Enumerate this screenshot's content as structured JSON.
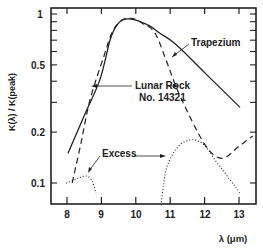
{
  "chart_data": {
    "type": "line",
    "title": "",
    "xlabel": "λ (μm)",
    "ylabel": "K(λ) / K(peak)",
    "xscale": "linear",
    "yscale": "log",
    "xlim": [
      7.5,
      13.5
    ],
    "ylim": [
      0.08,
      1.05
    ],
    "grid": false,
    "legend": "inline annotations with arrows",
    "x_ticks": [
      8,
      9,
      10,
      11,
      12,
      13
    ],
    "x_tick_labels": [
      "8",
      "9",
      "10",
      "11",
      "12",
      "13"
    ],
    "y_major_ticks": [
      0.1,
      0.2,
      0.5,
      1
    ],
    "y_tick_labels": [
      "0.1",
      "0.2",
      "0.5",
      "1"
    ],
    "y_minor_ticks": [
      0.3,
      0.4,
      0.6,
      0.7,
      0.8,
      0.9
    ],
    "series": [
      {
        "name": "Trapezium",
        "style": "solid",
        "x": [
          8.03,
          8.5,
          8.96,
          9.25,
          9.45,
          9.66,
          10.0,
          10.4,
          10.7,
          11.17,
          12.0,
          13.03
        ],
        "y": [
          0.15,
          0.25,
          0.41,
          0.7,
          0.86,
          0.93,
          0.92,
          0.85,
          0.77,
          0.66,
          0.45,
          0.28
        ]
      },
      {
        "name": "Lunar Rock No. 14321",
        "style": "dashed",
        "x": [
          8.15,
          8.4,
          8.67,
          9.08,
          9.3,
          9.54,
          9.83,
          10.2,
          10.56,
          10.9,
          11.28,
          12.0,
          12.5,
          13.0,
          13.4
        ],
        "y": [
          0.1,
          0.17,
          0.31,
          0.57,
          0.77,
          0.9,
          0.95,
          0.88,
          0.77,
          0.52,
          0.33,
          0.17,
          0.14,
          0.165,
          0.19
        ]
      },
      {
        "name": "Excess (8-9 μm)",
        "style": "dotted",
        "x": [
          7.97,
          8.2,
          8.38,
          8.58,
          8.7,
          8.76,
          8.84
        ],
        "y": [
          0.1,
          0.104,
          0.108,
          0.11,
          0.105,
          0.1,
          0.087
        ]
      },
      {
        "name": "Excess (11-13 μm)",
        "style": "dotted",
        "x": [
          10.73,
          10.8,
          10.88,
          11.05,
          11.28,
          11.58,
          11.87,
          12.1,
          12.3,
          12.55,
          12.74,
          12.9,
          13.03
        ],
        "y": [
          0.074,
          0.095,
          0.12,
          0.145,
          0.168,
          0.18,
          0.175,
          0.158,
          0.137,
          0.118,
          0.104,
          0.095,
          0.087
        ]
      }
    ],
    "annotations": [
      {
        "text": "Trapezium",
        "points_to": "Trapezium",
        "at": [
          11.3,
          0.62
        ]
      },
      {
        "text": "Lunar Rock",
        "line2": "No. 14321",
        "points_to": "Lunar Rock No. 14321",
        "at": [
          8.75,
          0.32
        ]
      },
      {
        "text": "Excess",
        "points_to": [
          "Excess (8-9 μm)",
          "Excess (11-13 μm)"
        ]
      }
    ]
  },
  "labels": {
    "y_axis": "K(λ) / K(peak)",
    "x_axis": "λ (μm)",
    "trapezium": "Trapezium",
    "lunar_line1": "Lunar Rock",
    "lunar_line2": "No. 14321",
    "excess": "Excess",
    "xt0": "8",
    "xt1": "9",
    "xt2": "10",
    "xt3": "11",
    "xt4": "12",
    "xt5": "13",
    "yt0": "1",
    "yt1": "0.5",
    "yt2": "0.2",
    "yt3": "0.1"
  }
}
